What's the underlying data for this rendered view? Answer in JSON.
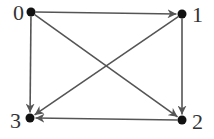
{
  "diagram": {
    "type": "directed-graph",
    "colors": {
      "edge": "#555555",
      "node": "#111111",
      "label": "#333333"
    },
    "nodes": [
      {
        "id": "0",
        "label": "0",
        "x": 31,
        "y": 12,
        "lx": 13,
        "ly": 20
      },
      {
        "id": "1",
        "label": "1",
        "x": 182,
        "y": 14,
        "lx": 192,
        "ly": 22
      },
      {
        "id": "2",
        "label": "2",
        "x": 182,
        "y": 120,
        "lx": 192,
        "ly": 129
      },
      {
        "id": "3",
        "label": "3",
        "x": 30,
        "y": 118,
        "lx": 10,
        "ly": 128
      }
    ],
    "edges": [
      {
        "from": "0",
        "to": "1"
      },
      {
        "from": "0",
        "to": "3"
      },
      {
        "from": "0",
        "to": "2"
      },
      {
        "from": "1",
        "to": "3"
      },
      {
        "from": "1",
        "to": "2"
      },
      {
        "from": "2",
        "to": "3"
      }
    ]
  }
}
